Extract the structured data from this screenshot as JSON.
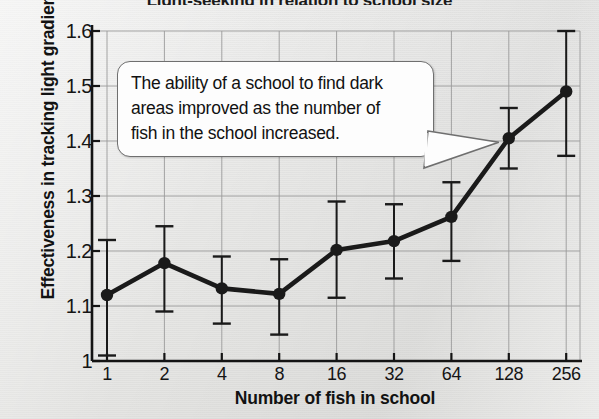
{
  "chart_data": {
    "type": "line",
    "title": "Light-seeking in relation to school size",
    "xlabel": "Number of fish in school",
    "ylabel": "Effectiveness in tracking light gradient",
    "grid": true,
    "legend": "none",
    "xscale": "log2",
    "categories": [
      "1",
      "2",
      "4",
      "8",
      "16",
      "32",
      "64",
      "128",
      "256"
    ],
    "x_tick_labels": [
      "1",
      "2",
      "4",
      "8",
      "16",
      "32",
      "64",
      "128",
      "256"
    ],
    "y_tick_labels": [
      "1",
      "1.1",
      "1.2",
      "1.3",
      "1.4",
      "1.5",
      "1.6"
    ],
    "ylim": [
      1.0,
      1.6
    ],
    "y_ticks": [
      1.0,
      1.1,
      1.2,
      1.3,
      1.4,
      1.5,
      1.6
    ],
    "series": [
      {
        "name": "Effectiveness in tracking light gradient",
        "marker": "filled-circle",
        "color": "#1a1a1a",
        "values": [
          1.12,
          1.178,
          1.132,
          1.122,
          1.202,
          1.218,
          1.262,
          1.405,
          1.49
        ],
        "error_high": [
          1.22,
          1.245,
          1.19,
          1.185,
          1.29,
          1.285,
          1.325,
          1.46,
          1.6
        ],
        "error_low": [
          1.01,
          1.09,
          1.068,
          1.048,
          1.115,
          1.15,
          1.182,
          1.35,
          1.373
        ]
      }
    ],
    "annotations": [
      {
        "name": "callout",
        "text": "The ability of a school to find dark areas improved as the number of fish in the school increased.",
        "points_to_x": "128",
        "points_to_y": 1.405
      }
    ]
  },
  "callout": {
    "line1": "The ability of a school to find dark",
    "line2": "areas improved as the number of",
    "line3": "fish in the school increased."
  }
}
